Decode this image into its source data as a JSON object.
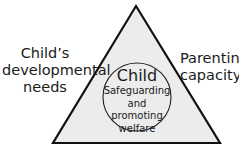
{
  "diagram": {
    "type": "triangle",
    "fill_color": "#ececec",
    "stroke_color": "#111111",
    "left_side_label": {
      "line1": "Child’s",
      "line2": "developmental",
      "line3": "needs"
    },
    "right_side_label": {
      "line1": "Parenting",
      "line2": "capacity"
    },
    "center": {
      "title": "Child",
      "subtitle_line1": "Safeguarding",
      "subtitle_line2": "and promoting",
      "subtitle_line3": "welfare"
    }
  }
}
